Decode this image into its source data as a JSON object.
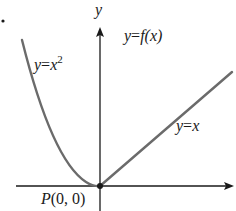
{
  "diagram": {
    "axes": {
      "x_label": "x",
      "y_label": "y"
    },
    "curves": [
      {
        "name": "parabola",
        "label_var": "y",
        "label_eq": "=",
        "label_base": "x",
        "label_exp": "2",
        "equation": "y = x^2",
        "domain": "x < 0"
      },
      {
        "name": "line",
        "label_var": "y",
        "label_eq": "=",
        "label_rhs": "x",
        "equation": "y = x",
        "domain": "x > 0"
      }
    ],
    "function_label": {
      "var": "y",
      "eq": "=",
      "fn": "f",
      "arg": "(x)"
    },
    "point": {
      "label_name": "P",
      "label_coords": "(0, 0)",
      "x": 0,
      "y": 0
    },
    "colors": {
      "curve": "#6b6b6b",
      "axis": "#1a1a1a",
      "text": "#1a1a1a"
    }
  }
}
